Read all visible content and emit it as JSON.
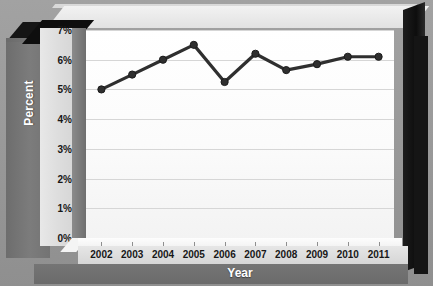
{
  "chart_data": {
    "type": "line",
    "title": "",
    "xlabel": "Year",
    "ylabel": "Percent",
    "categories": [
      "2002",
      "2003",
      "2004",
      "2005",
      "2006",
      "2007",
      "2008",
      "2009",
      "2010",
      "2011"
    ],
    "values": [
      5.0,
      5.5,
      6.0,
      6.5,
      5.25,
      6.2,
      5.65,
      5.85,
      6.1,
      6.1
    ],
    "ylim": [
      0,
      7
    ],
    "ytick_labels": [
      "0%",
      "1%",
      "2%",
      "3%",
      "4%",
      "5%",
      "6%",
      "7%"
    ],
    "ytick_values": [
      0,
      1,
      2,
      3,
      4,
      5,
      6,
      7
    ],
    "grid": true,
    "legend": false,
    "series_color": "#2f2f2f",
    "marker": "circle",
    "style": "3d-framed-grayscale"
  },
  "frame": {
    "wall_color": "#757575",
    "plot_background": "#ffffff",
    "gridline_color": "#d6d6d6",
    "axis_text_color": "#171717",
    "axis_title_color": "#ffffff",
    "outer_background": "#9a9a9a"
  }
}
